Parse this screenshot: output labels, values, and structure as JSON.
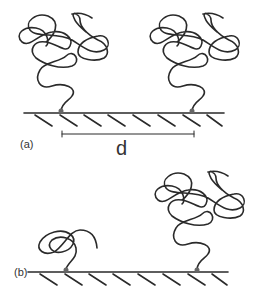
{
  "panels": [
    {
      "label": "(a)",
      "description": "Two grafted polymer coils (mushroom regime) separated by distance d"
    },
    {
      "label": "(b)",
      "description": "A small collapsed coil and a large swollen coil grafted to a surface"
    }
  ],
  "annotations": {
    "distance_label": "d"
  },
  "colors": {
    "line": "#2a2a2a",
    "graft_point": "#666666",
    "background": "#ffffff"
  }
}
